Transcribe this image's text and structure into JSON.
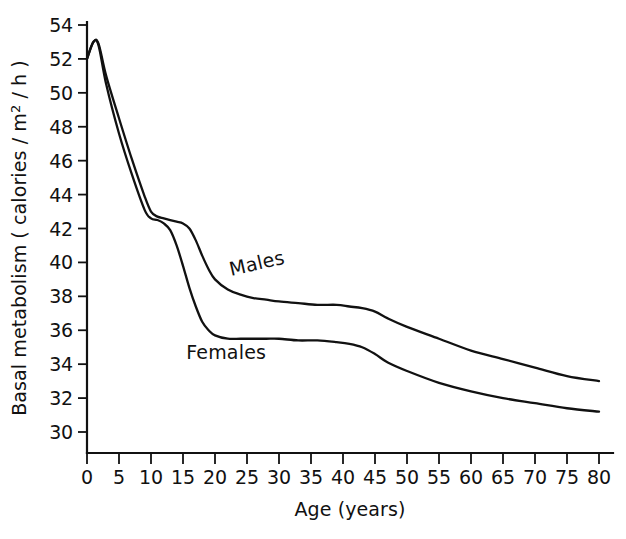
{
  "chart_data": {
    "type": "line",
    "title": "",
    "xlabel": "Age (years)",
    "ylabel": "Basal metabolism (calories/m2/h)",
    "ylabel_parts": {
      "prefix": "Basal metabolism ( calories / m",
      "superscript": "2",
      "suffix": " / h )"
    },
    "xlim": [
      0,
      80
    ],
    "ylim": [
      29,
      55
    ],
    "grid": false,
    "legend_position": "inline-curve-labels",
    "xticks": [
      0,
      5,
      10,
      15,
      20,
      25,
      30,
      35,
      40,
      45,
      50,
      55,
      60,
      65,
      70,
      75,
      80
    ],
    "xtick_labels": [
      "0",
      "5",
      "10",
      "15",
      "20",
      "25",
      "30",
      "35",
      "40",
      "45",
      "50",
      "55",
      "60",
      "65",
      "70",
      "75",
      "80"
    ],
    "yticks": [
      30,
      32,
      34,
      36,
      38,
      40,
      42,
      44,
      46,
      48,
      50,
      52,
      54
    ],
    "ytick_labels": [
      "30",
      "32",
      "34",
      "36",
      "38",
      "40",
      "42",
      "44",
      "46",
      "48",
      "50",
      "52",
      "54"
    ],
    "series": [
      {
        "name": "Males",
        "label": "Males",
        "label_at": {
          "x": 22.5,
          "y": 39.2
        },
        "label_rotation": -13,
        "color": "#111111",
        "x": [
          0,
          1.0,
          1.8,
          3,
          5,
          7,
          9,
          10,
          11,
          12,
          13,
          14,
          15,
          16,
          17,
          18,
          19,
          20,
          22,
          24,
          26,
          28,
          30,
          33,
          36,
          39,
          41,
          43,
          45,
          47,
          50,
          55,
          60,
          65,
          70,
          75,
          80
        ],
        "y": [
          52.0,
          53.0,
          52.9,
          51.0,
          48.5,
          46.1,
          43.9,
          43.0,
          42.7,
          42.6,
          42.5,
          42.4,
          42.3,
          42.0,
          41.3,
          40.4,
          39.6,
          39.0,
          38.4,
          38.1,
          37.9,
          37.8,
          37.7,
          37.6,
          37.5,
          37.5,
          37.4,
          37.3,
          37.1,
          36.7,
          36.2,
          35.5,
          34.8,
          34.3,
          33.8,
          33.3,
          33.0
        ]
      },
      {
        "name": "Females",
        "label": "Females",
        "label_at": {
          "x": 15.5,
          "y": 34.3
        },
        "label_rotation": 0,
        "color": "#111111",
        "x": [
          0,
          1.0,
          1.8,
          3,
          5,
          7,
          9,
          10,
          11,
          12,
          13,
          14,
          15,
          16,
          17,
          18,
          19,
          20,
          22,
          24,
          26,
          28,
          30,
          33,
          36,
          39,
          41,
          43,
          45,
          47,
          50,
          55,
          60,
          65,
          70,
          75,
          80
        ],
        "y": [
          52.0,
          53.0,
          52.8,
          50.5,
          47.6,
          45.2,
          43.1,
          42.6,
          42.5,
          42.3,
          41.9,
          41.0,
          39.8,
          38.5,
          37.4,
          36.5,
          36.0,
          35.7,
          35.5,
          35.5,
          35.5,
          35.5,
          35.5,
          35.4,
          35.4,
          35.3,
          35.2,
          35.0,
          34.6,
          34.1,
          33.6,
          32.9,
          32.4,
          32.0,
          31.7,
          31.4,
          31.2
        ]
      }
    ],
    "notes": {
      "peak_age": 1.0,
      "peak_value": 53.0,
      "axis_color": "#111111",
      "background": "#ffffff"
    }
  },
  "figure": {
    "background": "#ffffff",
    "line_color": "#111111"
  }
}
